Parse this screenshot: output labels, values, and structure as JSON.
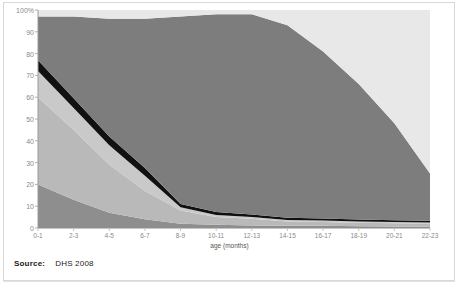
{
  "source": {
    "label": "Source:",
    "value": "DHS 2008"
  },
  "colors": {
    "band_exclusive_breastfeeding": "#8e8e8e",
    "band_breastmilk_water": "#b9b9b9",
    "band_breastmilk_other_milk": "#c9c9c9",
    "band_breastmilk_complementary_black": "#111111",
    "band_not_breastfeeding": "#7d7d7d",
    "band_top_light": "#e8e8e8",
    "axis_text": "#8a8a8a",
    "frame": "#d8d8d8",
    "source_text": "#1b1b1b"
  },
  "chart_data": {
    "type": "area",
    "title": "",
    "subtitle": "",
    "xlabel": "age (months)",
    "ylabel": "",
    "ylim": [
      0,
      100
    ],
    "ytick_labels": [
      "0",
      "10",
      "20",
      "30",
      "40",
      "50",
      "60",
      "70",
      "80",
      "90",
      "100%"
    ],
    "yticks": [
      0,
      10,
      20,
      30,
      40,
      50,
      60,
      70,
      80,
      90,
      100
    ],
    "grid": false,
    "legend_position": "none",
    "stacked_percent": true,
    "categories": [
      "0-1",
      "2-3",
      "4-5",
      "6-7",
      "8-9",
      "10-11",
      "12-13",
      "14-15",
      "16-17",
      "18-19",
      "20-21",
      "22-23"
    ],
    "x": [
      0,
      1,
      2,
      3,
      4,
      5,
      6,
      7,
      8,
      9,
      10,
      11
    ],
    "series": [
      {
        "name": "exclusively breastfed",
        "color": "#8e8e8e",
        "values": [
          20,
          13,
          7,
          4,
          2,
          1.5,
          1.2,
          1,
          1,
          0.8,
          0.7,
          0.6
        ]
      },
      {
        "name": "breastfed and plain water",
        "color": "#b9b9b9",
        "values": [
          40,
          32,
          22,
          13,
          6,
          3.5,
          3,
          2,
          1.8,
          1.6,
          1.5,
          1.4
        ]
      },
      {
        "name": "breastfed and other milk/liquids",
        "color": "#c9c9c9",
        "values": [
          12,
          10,
          9,
          7,
          1.5,
          1,
          0.8,
          0.7,
          0.6,
          0.6,
          0.5,
          0.5
        ]
      },
      {
        "name": "breastfed and complementary foods",
        "color": "#111111",
        "values": [
          5,
          4.5,
          4,
          3.5,
          1.5,
          1.3,
          1.2,
          1,
          1,
          0.9,
          0.8,
          0.8
        ]
      },
      {
        "name": "not breastfeeding",
        "color": "#7d7d7d",
        "values": [
          20,
          37.5,
          54,
          68.5,
          86,
          90.7,
          91.8,
          88.3,
          76.6,
          62.1,
          44.5,
          21.7
        ]
      },
      {
        "name": "remainder",
        "color": "#e8e8e8",
        "values": [
          3,
          3,
          4,
          4,
          3,
          2,
          2,
          7,
          19,
          34,
          52,
          75
        ]
      }
    ],
    "cumulative_top_boundaries": {
      "exclusively_breastfed": [
        20,
        13,
        7,
        4,
        2,
        1.5,
        1.2,
        1,
        1,
        0.8,
        0.7,
        0.6
      ],
      "plus_plain_water": [
        60,
        45,
        29,
        17,
        8,
        5,
        4.2,
        3,
        2.8,
        2.4,
        2.2,
        2.0
      ],
      "plus_other_milk": [
        72,
        55,
        38,
        24,
        9.5,
        6,
        5,
        3.7,
        3.4,
        3.0,
        2.7,
        2.5
      ],
      "plus_complementary_black": [
        77,
        59.5,
        42,
        27.5,
        11,
        7.3,
        6.2,
        4.7,
        4.4,
        3.9,
        3.5,
        3.3
      ],
      "plus_not_breastfeeding": [
        97,
        97,
        96,
        96,
        97,
        98,
        98,
        93,
        81,
        66,
        48,
        25
      ]
    }
  },
  "plot_geometry": {
    "left_px": 38,
    "right_px": 430,
    "top_px": 10,
    "bottom_px": 228
  }
}
